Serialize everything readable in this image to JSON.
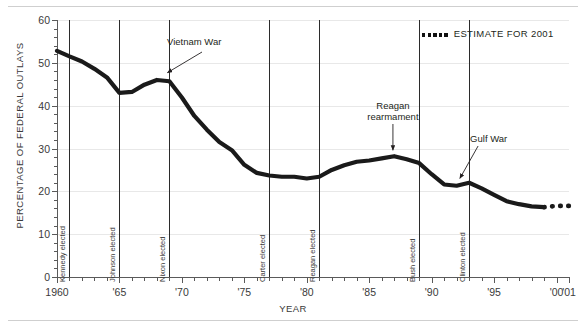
{
  "axes": {
    "ylabel": "PERCENTAGE OF FEDERAL OUTLAYS",
    "xlabel": "YEAR"
  },
  "legend": {
    "estimate_label": "ESTIMATE FOR 2001",
    "estimate_style": "thick-dotted",
    "estimate_color": "#111111"
  },
  "annotations": [
    {
      "text": "Vietnam War",
      "year": 1969.2,
      "value": 46.0
    },
    {
      "text": "Reagan",
      "year": 1986.9,
      "value": 28.2
    },
    {
      "text": "rearmament",
      "year": 1986.9,
      "value": 28.2
    },
    {
      "text": "Gulf War",
      "year": 1992.0,
      "value": 21.6
    }
  ],
  "events": [
    {
      "label": "Kennedy elected",
      "year": 1961
    },
    {
      "label": "Johnson elected",
      "year": 1965
    },
    {
      "label": "Nixon elected",
      "year": 1969
    },
    {
      "label": "Carter elected",
      "year": 1977
    },
    {
      "label": "Reagan elected",
      "year": 1981
    },
    {
      "label": "Bush elected",
      "year": 1989
    },
    {
      "label": "Clinton elected",
      "year": 1993
    }
  ],
  "chart_data": {
    "type": "line",
    "title": "",
    "xlabel": "YEAR",
    "ylabel": "PERCENTAGE OF FEDERAL OUTLAYS",
    "xlim": [
      1960,
      2001
    ],
    "ylim": [
      0,
      60
    ],
    "yticks": [
      0,
      10,
      20,
      30,
      40,
      50,
      60
    ],
    "ytick_minor_step": 2,
    "xticks": [
      1960,
      1965,
      1970,
      1975,
      1980,
      1985,
      1990,
      1995,
      2000,
      2001
    ],
    "xtick_labels": [
      "1960",
      "'65",
      "'70",
      "'75",
      "'80",
      "'85",
      "'90",
      "'95",
      "'00",
      "'01"
    ],
    "xtick_minor_step": 1,
    "grid": "horizontal",
    "legend_position": "top-right",
    "series": [
      {
        "name": "Defense share of federal outlays",
        "style": "solid",
        "x": [
          1960,
          1961,
          1962,
          1963,
          1964,
          1965,
          1966,
          1967,
          1968,
          1969,
          1970,
          1971,
          1972,
          1973,
          1974,
          1975,
          1976,
          1977,
          1978,
          1979,
          1980,
          1981,
          1982,
          1983,
          1984,
          1985,
          1986,
          1987,
          1988,
          1989,
          1990,
          1991,
          1992,
          1993,
          1994,
          1995,
          1996,
          1997,
          1998,
          1999
        ],
        "values": [
          52.8,
          51.5,
          50.3,
          48.6,
          46.6,
          43.0,
          43.2,
          44.9,
          46.0,
          45.7,
          41.9,
          37.6,
          34.4,
          31.5,
          29.6,
          26.2,
          24.3,
          23.7,
          23.4,
          23.4,
          23.0,
          23.4,
          25.0,
          26.1,
          26.9,
          27.2,
          27.7,
          28.2,
          27.5,
          26.6,
          24.0,
          21.6,
          21.3,
          22.0,
          20.7,
          19.2,
          17.7,
          17.0,
          16.5,
          16.3
        ]
      },
      {
        "name": "Estimate for 2001",
        "style": "thick-dotted",
        "x": [
          1999,
          2000,
          2001
        ],
        "values": [
          16.3,
          16.6,
          16.6
        ]
      }
    ]
  }
}
